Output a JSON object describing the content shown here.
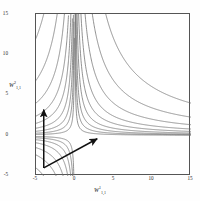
{
  "figure": {
    "kind": "contour-plot",
    "background_color": "#ffffff",
    "frame_color": "#555555",
    "contour_color": "#6e6e6e",
    "arrow_color": "#111111"
  },
  "axes": {
    "x": {
      "label_var": "W",
      "label_sup": "1",
      "label_sub": "1,1",
      "ticks": [
        "-5",
        "0",
        "5",
        "10",
        "15"
      ],
      "tick_values": [
        -5,
        0,
        5,
        10,
        15
      ],
      "min": -5,
      "max": 15
    },
    "y": {
      "label_var": "W",
      "label_sup": "2",
      "label_sub": "1,1",
      "ticks": [
        "15",
        "10",
        "5",
        "0",
        "-5"
      ],
      "tick_values": [
        15,
        10,
        5,
        0,
        -5
      ],
      "min": -5,
      "max": 15
    }
  },
  "chart_data": {
    "type": "line",
    "title": "",
    "xlabel": "W^1_{1,1}",
    "ylabel": "W^2_{1,1}",
    "xlim": [
      -5,
      15
    ],
    "ylim": [
      -5,
      15
    ],
    "grid": false,
    "legend": "none",
    "contour_family": "hyperbolas x*y = c",
    "contour_levels": [
      0.6,
      1.4,
      2.6,
      4.5,
      7.5,
      12,
      20,
      34,
      60
    ],
    "annotations": [
      {
        "name": "vertical-arrow",
        "type": "arrow",
        "start": [
          -4.0,
          -4.0
        ],
        "end": [
          -4.0,
          3.2
        ]
      },
      {
        "name": "diagonal-arrow",
        "type": "arrow",
        "start": [
          -4.0,
          -4.0
        ],
        "end": [
          2.9,
          -0.4
        ]
      }
    ]
  }
}
